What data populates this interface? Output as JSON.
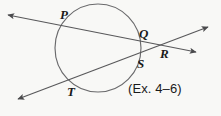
{
  "figure": {
    "type": "geometry-diagram",
    "background_color": "#f8f8f6",
    "stroke_color": "#58585a",
    "label_color": "#1a1a1a",
    "caption": "(Ex. 4–6)",
    "circle": {
      "center_x": 98,
      "center_y": 48,
      "radius_x": 43,
      "radius_y": 44
    },
    "labels": [
      {
        "text": "P",
        "x": 60,
        "y": 8
      },
      {
        "text": "Q",
        "x": 139,
        "y": 27
      },
      {
        "text": "R",
        "x": 160,
        "y": 47
      },
      {
        "text": "S",
        "x": 137,
        "y": 57
      },
      {
        "text": "T",
        "x": 67,
        "y": 85
      }
    ],
    "points": [
      {
        "name": "P",
        "x": 63,
        "y": 25
      },
      {
        "name": "Q",
        "x": 141,
        "y": 41
      },
      {
        "name": "R",
        "x": 160,
        "y": 43
      },
      {
        "name": "S",
        "x": 134,
        "y": 55
      },
      {
        "name": "T",
        "x": 73,
        "y": 83
      }
    ],
    "lines": [
      {
        "name": "secant-P-Q-R",
        "x1": 8,
        "y1": 15,
        "x2": 196,
        "y2": 52
      },
      {
        "name": "secant-T-S-R",
        "x1": 18,
        "y1": 99,
        "x2": 208,
        "y2": 27
      }
    ],
    "arrowheads": [
      {
        "name": "arrow-upper-left",
        "x": 7,
        "y": 14
      },
      {
        "name": "arrow-lower-left",
        "x": 17,
        "y": 98
      },
      {
        "name": "arrow-upper-right",
        "x": 207,
        "y": 28
      },
      {
        "name": "arrow-lower-right",
        "x": 195,
        "y": 51
      }
    ]
  }
}
